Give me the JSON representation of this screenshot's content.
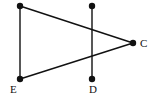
{
  "diagram": {
    "points": [
      {
        "id": "A",
        "label": "",
        "x": 20,
        "y": 6
      },
      {
        "id": "B",
        "label": "",
        "x": 92,
        "y": 6
      },
      {
        "id": "C",
        "label": "C",
        "x": 133,
        "y": 43,
        "lx": 140,
        "ly": 47
      },
      {
        "id": "D",
        "label": "D",
        "x": 92,
        "y": 79,
        "lx": 89,
        "ly": 93
      },
      {
        "id": "E",
        "label": "E",
        "x": 20,
        "y": 79,
        "lx": 10,
        "ly": 93
      }
    ],
    "segments": [
      [
        "A",
        "E"
      ],
      [
        "A",
        "C"
      ],
      [
        "E",
        "C"
      ],
      [
        "B",
        "D"
      ]
    ],
    "colors": {
      "stroke": "#111111",
      "point": "#111111"
    }
  }
}
